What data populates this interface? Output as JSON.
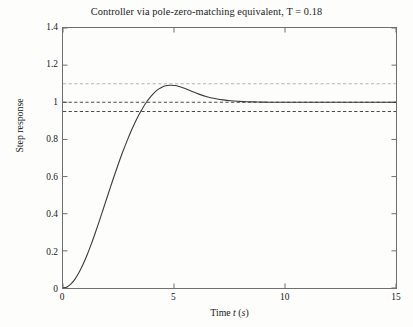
{
  "chart_data": {
    "type": "line",
    "title": "Controller via pole-zero-matching equivalent, T = 0.18",
    "xlabel": "Time t (s)",
    "ylabel": "Step response",
    "xlim": [
      0,
      15
    ],
    "ylim": [
      0,
      1.4
    ],
    "xticks": [
      0,
      5,
      10,
      15
    ],
    "xtick_labels": [
      "0",
      "5",
      "10",
      "15"
    ],
    "yticks": [
      0,
      0.2,
      0.4,
      0.6,
      0.8,
      1,
      1.2,
      1.4
    ],
    "ytick_labels": [
      "0",
      "0.2",
      "0.4",
      "0.6",
      "0.8",
      "1",
      "1.2",
      "1.4"
    ],
    "grid": false,
    "legend": "none",
    "frame": "box",
    "tick_direction": "in",
    "series": [
      {
        "name": "step response",
        "style": "solid",
        "color": "#3b3b3b",
        "x": [
          0.0,
          0.18,
          0.36,
          0.54,
          0.72,
          0.9,
          1.08,
          1.26,
          1.44,
          1.62,
          1.8,
          1.98,
          2.16,
          2.34,
          2.52,
          2.7,
          2.88,
          3.06,
          3.24,
          3.42,
          3.6,
          3.78,
          3.96,
          4.14,
          4.32,
          4.5,
          4.68,
          4.86,
          5.04,
          5.22,
          5.4,
          5.76,
          6.12,
          6.48,
          6.84,
          7.2,
          7.56,
          7.92,
          8.28,
          8.64,
          9.0,
          9.5,
          10.0,
          10.5,
          11.0,
          11.5,
          12.0,
          12.5,
          13.0,
          13.5,
          14.0,
          14.5,
          15.0
        ],
        "y": [
          0.0,
          0.006,
          0.022,
          0.048,
          0.083,
          0.126,
          0.176,
          0.232,
          0.292,
          0.355,
          0.42,
          0.486,
          0.551,
          0.615,
          0.677,
          0.736,
          0.791,
          0.843,
          0.89,
          0.933,
          0.971,
          1.004,
          1.032,
          1.055,
          1.072,
          1.084,
          1.09,
          1.092,
          1.09,
          1.085,
          1.078,
          1.061,
          1.044,
          1.03,
          1.02,
          1.013,
          1.008,
          1.005,
          1.003,
          1.002,
          1.001,
          1.0,
          1.0,
          1.0,
          1.0,
          1.0,
          1.0,
          1.0,
          1.0,
          1.0,
          1.0,
          1.0,
          1.0
        ]
      }
    ],
    "reference_lines": [
      {
        "name": "overshoot-band-upper",
        "value": 1.1,
        "style": "dashed",
        "color": "#b5b5b5"
      },
      {
        "name": "steady-state",
        "value": 1.0,
        "style": "dashed",
        "color": "#4a4a4a"
      },
      {
        "name": "settling-band-lower",
        "value": 0.95,
        "style": "dashed",
        "color": "#4a4a4a"
      }
    ]
  },
  "figure": {
    "title": "Controller via pole-zero-matching equivalent, T = 0.18",
    "xlabel": "Time t (s)",
    "ylabel": "Step response",
    "xtick_labels": [
      "0",
      "5",
      "10",
      "15"
    ],
    "ytick_labels": [
      "0",
      "0.2",
      "0.4",
      "0.6",
      "0.8",
      "1",
      "1.2",
      "1.4"
    ],
    "colors": {
      "curve": "#3b3b3b",
      "frame": "#6f6f6f",
      "dash_dark": "#4a4a4a",
      "dash_light": "#b5b5b5",
      "background": "#fdfdfc",
      "text": "#171717"
    }
  }
}
